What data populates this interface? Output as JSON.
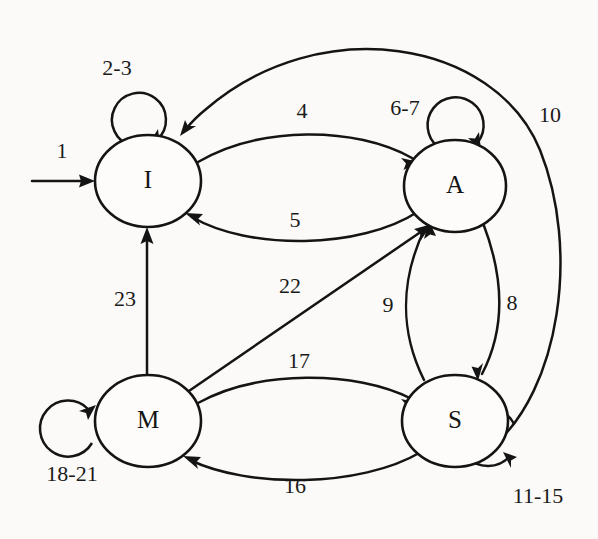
{
  "diagram": {
    "type": "finite-state-machine",
    "background_color": "#fbfaf8",
    "stroke_color": "#141414",
    "node_fill": "#fdfcfa",
    "nodes": [
      {
        "id": "I",
        "label": "I",
        "cx": 148,
        "cy": 181,
        "rx": 53,
        "ry": 46
      },
      {
        "id": "A",
        "label": "A",
        "cx": 455,
        "cy": 186,
        "rx": 51,
        "ry": 46
      },
      {
        "id": "M",
        "label": "M",
        "cx": 148,
        "cy": 421,
        "rx": 53,
        "ry": 46
      },
      {
        "id": "S",
        "label": "S",
        "cx": 455,
        "cy": 421,
        "rx": 53,
        "ry": 46
      }
    ],
    "start_arrow": {
      "label": "1",
      "from": "start",
      "to": "I",
      "label_x": 62,
      "label_y": 153
    },
    "self_loops": [
      {
        "node": "I",
        "label": "2-3",
        "label_x": 117,
        "label_y": 70,
        "cx": 122,
        "cy": 121,
        "r": 27
      },
      {
        "node": "A",
        "label": "6-7",
        "label_x": 405,
        "label_y": 110,
        "cx": 459,
        "cy": 125,
        "r": 28
      },
      {
        "node": "S",
        "label": "11-15",
        "label_x": 538,
        "label_y": 498,
        "cx": 534,
        "cy": 442,
        "r": 29
      },
      {
        "node": "M",
        "label": "18-21",
        "label_x": 72,
        "label_y": 476,
        "cx": 72,
        "cy": 425,
        "r": 28
      }
    ],
    "edges": [
      {
        "label": "4",
        "from": "I",
        "to": "A",
        "label_x": 302,
        "label_y": 113
      },
      {
        "label": "5",
        "from": "A",
        "to": "I",
        "label_x": 295,
        "label_y": 222
      },
      {
        "label": "8",
        "from": "A",
        "to": "S",
        "label_x": 512,
        "label_y": 305
      },
      {
        "label": "9",
        "from": "S",
        "to": "A",
        "label_x": 388,
        "label_y": 307
      },
      {
        "label": "10",
        "from": "S",
        "to": "I",
        "label_x": 550,
        "label_y": 117
      },
      {
        "label": "16",
        "from": "S",
        "to": "M",
        "label_x": 295,
        "label_y": 488
      },
      {
        "label": "17",
        "from": "M",
        "to": "S",
        "label_x": 299,
        "label_y": 363
      },
      {
        "label": "22",
        "from": "M",
        "to": "A",
        "label_x": 290,
        "label_y": 288
      },
      {
        "label": "23",
        "from": "M",
        "to": "I",
        "label_x": 125,
        "label_y": 301
      }
    ]
  }
}
